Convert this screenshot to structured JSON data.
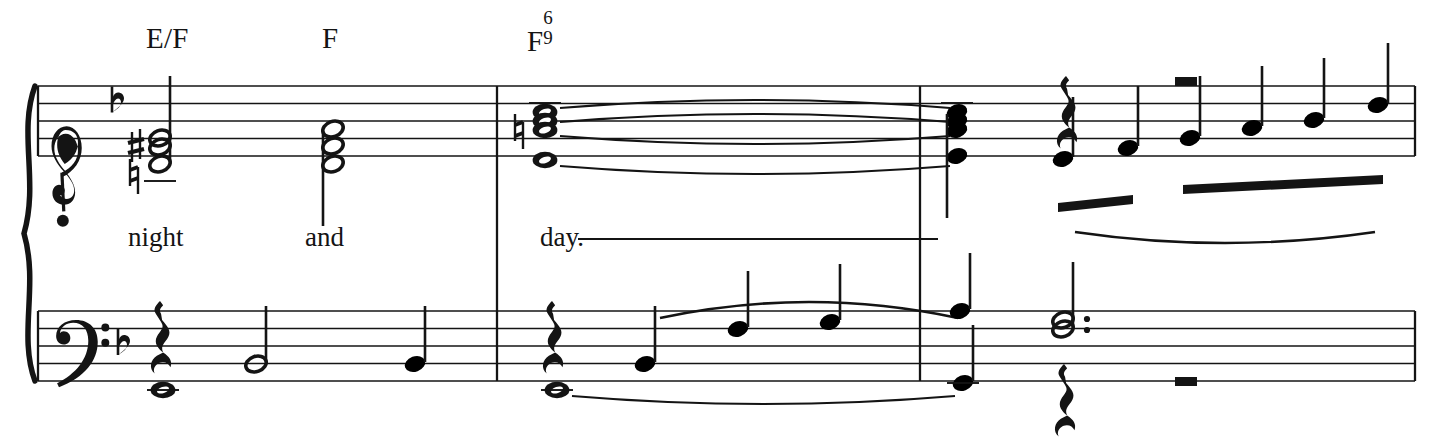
{
  "document": {
    "type": "music-notation",
    "description": "Piano-vocal score system, two measures plus pickup, key of F major (one flat)",
    "background_color": "#ffffff",
    "ink_color": "#141414"
  },
  "chord_symbols": [
    {
      "name": "chord-symbol-e-over-f",
      "root": "E/F",
      "sup": "",
      "sub": "",
      "x": 146,
      "y": 22
    },
    {
      "name": "chord-symbol-f",
      "root": "F",
      "sup": "",
      "sub": "",
      "x": 322,
      "y": 22
    },
    {
      "name": "chord-symbol-f-six-nine",
      "root": "F",
      "sup": "6",
      "sub": "9",
      "x": 527,
      "y": 22
    }
  ],
  "lyrics": [
    {
      "name": "lyric-night",
      "text": "night",
      "x": 128,
      "y": 222
    },
    {
      "name": "lyric-and",
      "text": "and",
      "x": 305,
      "y": 222
    },
    {
      "name": "lyric-day",
      "text": "day.",
      "x": 540,
      "y": 222,
      "extender": {
        "x1": 578,
        "x2": 938,
        "y": 239
      }
    }
  ],
  "staves": {
    "treble": {
      "top": 86,
      "line_gap": 17.5,
      "lines": 5,
      "clef": "treble-clef",
      "key_signature": "one-flat"
    },
    "bass": {
      "top": 311,
      "line_gap": 17.5,
      "lines": 5,
      "clef": "bass-clef",
      "key_signature": "one-flat"
    }
  },
  "system": {
    "brace": true,
    "left_barline_x": 38,
    "right_barline_x": 1415,
    "staff_left": 38,
    "staff_right": 1415,
    "barlines": [
      497,
      920
    ]
  },
  "treble_events": [
    {
      "name": "chord-half-m1",
      "type": "chord",
      "duration": "half",
      "x": 160,
      "stem": "up",
      "accidentals": [
        "sharp",
        "natural"
      ],
      "notes_y": [
        138,
        147,
        164
      ],
      "ledger": []
    },
    {
      "name": "chord-half-m2",
      "type": "chord",
      "duration": "half",
      "x": 333,
      "stem": "down",
      "accidentals": [],
      "notes_y": [
        129,
        146,
        164
      ],
      "ledger": []
    },
    {
      "name": "chord-whole-m3",
      "type": "chord",
      "duration": "whole",
      "x": 545,
      "stem": "none",
      "accidentals": [
        "natural"
      ],
      "notes_y": [
        112,
        121,
        130,
        160
      ],
      "ledger": []
    },
    {
      "name": "chord-quarter-m4",
      "type": "chord",
      "duration": "quarter",
      "x": 957,
      "stem": "down",
      "accidentals": [],
      "notes_y": [
        112,
        121,
        130,
        156
      ],
      "ledger": []
    },
    {
      "name": "rest-quarter-treble",
      "type": "rest",
      "duration": "quarter",
      "x": 1066,
      "y": 95
    },
    {
      "name": "rest-half-treble",
      "type": "rest",
      "duration": "half",
      "x": 1186,
      "y": 86
    },
    {
      "name": "eighth-note-1",
      "type": "note",
      "duration": "eighth",
      "x": 1063,
      "y": 159,
      "stem": "up"
    },
    {
      "name": "eighth-note-2",
      "type": "note",
      "duration": "eighth",
      "x": 1128,
      "y": 148,
      "stem": "up"
    },
    {
      "name": "eighth-note-3",
      "type": "note",
      "duration": "eighth",
      "x": 1190,
      "y": 138,
      "stem": "up"
    },
    {
      "name": "eighth-note-4",
      "type": "note",
      "duration": "eighth",
      "x": 1252,
      "y": 128,
      "stem": "up"
    },
    {
      "name": "eighth-note-5",
      "type": "note",
      "duration": "eighth",
      "x": 1314,
      "y": 120,
      "stem": "up"
    },
    {
      "name": "eighth-note-6",
      "type": "note",
      "duration": "eighth",
      "x": 1378,
      "y": 105,
      "stem": "up"
    }
  ],
  "treble_ties": [
    {
      "name": "tie-voice-1",
      "x1": 560,
      "x2": 950,
      "y": 108,
      "dir": "up"
    },
    {
      "name": "tie-voice-2",
      "x1": 560,
      "x2": 950,
      "y": 122,
      "dir": "up"
    },
    {
      "name": "tie-voice-3",
      "x1": 560,
      "x2": 950,
      "y": 136,
      "dir": "down"
    },
    {
      "name": "tie-voice-4",
      "x1": 560,
      "x2": 950,
      "y": 166,
      "dir": "down"
    }
  ],
  "treble_beams": [
    {
      "name": "beam-group-1",
      "x1": 1058,
      "x2": 1133,
      "y": 203,
      "thickness": 9
    },
    {
      "name": "beam-group-2",
      "x1": 1183,
      "x2": 1383,
      "y": 185,
      "thickness": 9
    }
  ],
  "treble_slurs": [
    {
      "name": "slur-eighth-run",
      "x1": 1075,
      "x2": 1375,
      "y": 232,
      "depth": 22,
      "dir": "down"
    }
  ],
  "bass_events": [
    {
      "name": "rest-quarter-bass-m1",
      "type": "rest",
      "duration": "quarter",
      "x": 160,
      "y": 320
    },
    {
      "name": "whole-note-bass-m1",
      "type": "note",
      "duration": "whole",
      "x": 163,
      "y": 390
    },
    {
      "name": "half-note-bass-m1",
      "type": "note",
      "duration": "half",
      "x": 256,
      "y": 364,
      "stem": "up"
    },
    {
      "name": "quarter-note-bass-m2",
      "type": "note",
      "duration": "quarter",
      "x": 415,
      "y": 364,
      "stem": "up"
    },
    {
      "name": "rest-quarter-bass-m3",
      "type": "rest",
      "duration": "quarter",
      "x": 552,
      "y": 320
    },
    {
      "name": "whole-note-bass-m3",
      "type": "note",
      "duration": "whole",
      "x": 557,
      "y": 390
    },
    {
      "name": "quarter-note-bass-1",
      "type": "note",
      "duration": "quarter",
      "x": 645,
      "y": 364,
      "stem": "up"
    },
    {
      "name": "quarter-note-bass-2",
      "type": "note",
      "duration": "quarter",
      "x": 738,
      "y": 329,
      "stem": "up"
    },
    {
      "name": "quarter-note-bass-3",
      "type": "note",
      "duration": "quarter",
      "x": 830,
      "y": 322,
      "stem": "up"
    },
    {
      "name": "quarter-note-bass-4",
      "type": "note",
      "duration": "quarter",
      "x": 960,
      "y": 311,
      "stem": "up"
    },
    {
      "name": "quarter-note-bass-5",
      "type": "note",
      "duration": "quarter",
      "x": 963,
      "y": 383,
      "stem": "up"
    },
    {
      "name": "chord-dotted-half-bass",
      "type": "chord",
      "duration": "dotted-half",
      "x": 1063,
      "stem": "up",
      "notes_y": [
        320,
        329
      ],
      "dot": true
    },
    {
      "name": "rest-quarter-bass-end",
      "type": "rest",
      "duration": "quarter",
      "x": 1064,
      "y": 383
    },
    {
      "name": "rest-half-bass-end",
      "type": "rest",
      "duration": "half",
      "x": 1186,
      "y": 386
    }
  ],
  "bass_ties": [
    {
      "name": "tie-bass-whole",
      "x1": 572,
      "x2": 955,
      "y": 396,
      "dir": "down"
    }
  ],
  "bass_slurs": [
    {
      "name": "slur-bass-phrase",
      "x1": 660,
      "x2": 958,
      "y": 318,
      "depth": 32,
      "dir": "up"
    }
  ]
}
